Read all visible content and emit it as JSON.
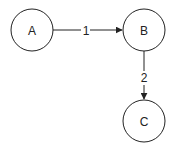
{
  "diagram": {
    "type": "directed-graph",
    "nodes": [
      {
        "id": "A",
        "label": "A",
        "cx": 32,
        "cy": 30,
        "r": 21
      },
      {
        "id": "B",
        "label": "B",
        "cx": 144,
        "cy": 30,
        "r": 21
      },
      {
        "id": "C",
        "label": "C",
        "cx": 144,
        "cy": 121,
        "r": 21
      }
    ],
    "edges": [
      {
        "from": "A",
        "to": "B",
        "label": "1"
      },
      {
        "from": "B",
        "to": "C",
        "label": "2"
      }
    ],
    "colors": {
      "stroke": "#222222",
      "background": "#ffffff"
    }
  }
}
